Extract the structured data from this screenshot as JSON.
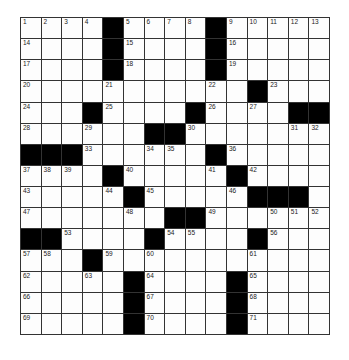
{
  "puzzle": {
    "rows": 15,
    "cols": 15,
    "grid": [
      "....#....#.....",
      "....#....#.....",
      "....#....#.....",
      "...........#...",
      "...#....#....##",
      "......##.......",
      "###......#.....",
      "....#.....#....",
      ".....#.....###.",
      ".......##......",
      "##....#....#...",
      "...#...........",
      ".....#....#....",
      ".....#....#....",
      ".....#....#...."
    ],
    "numbers": [
      {
        "r": 0,
        "c": 0,
        "n": "1"
      },
      {
        "r": 0,
        "c": 1,
        "n": "2"
      },
      {
        "r": 0,
        "c": 2,
        "n": "3"
      },
      {
        "r": 0,
        "c": 3,
        "n": "4"
      },
      {
        "r": 0,
        "c": 5,
        "n": "5"
      },
      {
        "r": 0,
        "c": 6,
        "n": "6"
      },
      {
        "r": 0,
        "c": 7,
        "n": "7"
      },
      {
        "r": 0,
        "c": 8,
        "n": "8"
      },
      {
        "r": 0,
        "c": 10,
        "n": "9"
      },
      {
        "r": 0,
        "c": 11,
        "n": "10"
      },
      {
        "r": 0,
        "c": 12,
        "n": "11"
      },
      {
        "r": 0,
        "c": 13,
        "n": "12"
      },
      {
        "r": 0,
        "c": 14,
        "n": "13"
      },
      {
        "r": 1,
        "c": 0,
        "n": "14"
      },
      {
        "r": 1,
        "c": 5,
        "n": "15"
      },
      {
        "r": 1,
        "c": 10,
        "n": "16"
      },
      {
        "r": 2,
        "c": 0,
        "n": "17"
      },
      {
        "r": 2,
        "c": 5,
        "n": "18"
      },
      {
        "r": 2,
        "c": 10,
        "n": "19"
      },
      {
        "r": 3,
        "c": 0,
        "n": "20"
      },
      {
        "r": 3,
        "c": 4,
        "n": "21"
      },
      {
        "r": 3,
        "c": 9,
        "n": "22"
      },
      {
        "r": 3,
        "c": 12,
        "n": "23"
      },
      {
        "r": 4,
        "c": 0,
        "n": "24"
      },
      {
        "r": 4,
        "c": 4,
        "n": "25"
      },
      {
        "r": 4,
        "c": 9,
        "n": "26"
      },
      {
        "r": 4,
        "c": 11,
        "n": "27"
      },
      {
        "r": 5,
        "c": 0,
        "n": "28"
      },
      {
        "r": 5,
        "c": 3,
        "n": "29"
      },
      {
        "r": 5,
        "c": 8,
        "n": "30"
      },
      {
        "r": 5,
        "c": 13,
        "n": "31"
      },
      {
        "r": 5,
        "c": 14,
        "n": "32"
      },
      {
        "r": 6,
        "c": 3,
        "n": "33"
      },
      {
        "r": 6,
        "c": 6,
        "n": "34"
      },
      {
        "r": 6,
        "c": 7,
        "n": "35"
      },
      {
        "r": 6,
        "c": 10,
        "n": "36"
      },
      {
        "r": 7,
        "c": 0,
        "n": "37"
      },
      {
        "r": 7,
        "c": 1,
        "n": "38"
      },
      {
        "r": 7,
        "c": 2,
        "n": "39"
      },
      {
        "r": 7,
        "c": 5,
        "n": "40"
      },
      {
        "r": 7,
        "c": 9,
        "n": "41"
      },
      {
        "r": 7,
        "c": 11,
        "n": "42"
      },
      {
        "r": 8,
        "c": 0,
        "n": "43"
      },
      {
        "r": 8,
        "c": 4,
        "n": "44"
      },
      {
        "r": 8,
        "c": 6,
        "n": "45"
      },
      {
        "r": 8,
        "c": 10,
        "n": "46"
      },
      {
        "r": 9,
        "c": 0,
        "n": "47"
      },
      {
        "r": 9,
        "c": 5,
        "n": "48"
      },
      {
        "r": 9,
        "c": 9,
        "n": "49"
      },
      {
        "r": 9,
        "c": 12,
        "n": "50"
      },
      {
        "r": 9,
        "c": 13,
        "n": "51"
      },
      {
        "r": 9,
        "c": 14,
        "n": "52"
      },
      {
        "r": 10,
        "c": 2,
        "n": "53"
      },
      {
        "r": 10,
        "c": 7,
        "n": "54"
      },
      {
        "r": 10,
        "c": 8,
        "n": "55"
      },
      {
        "r": 10,
        "c": 12,
        "n": "56"
      },
      {
        "r": 11,
        "c": 0,
        "n": "57"
      },
      {
        "r": 11,
        "c": 1,
        "n": "58"
      },
      {
        "r": 11,
        "c": 4,
        "n": "59"
      },
      {
        "r": 11,
        "c": 6,
        "n": "60"
      },
      {
        "r": 11,
        "c": 11,
        "n": "61"
      },
      {
        "r": 12,
        "c": 0,
        "n": "62"
      },
      {
        "r": 12,
        "c": 3,
        "n": "63"
      },
      {
        "r": 12,
        "c": 6,
        "n": "64"
      },
      {
        "r": 12,
        "c": 11,
        "n": "65"
      },
      {
        "r": 13,
        "c": 0,
        "n": "66"
      },
      {
        "r": 13,
        "c": 6,
        "n": "67"
      },
      {
        "r": 13,
        "c": 11,
        "n": "68"
      },
      {
        "r": 14,
        "c": 0,
        "n": "69"
      },
      {
        "r": 14,
        "c": 6,
        "n": "70"
      },
      {
        "r": 14,
        "c": 11,
        "n": "71"
      }
    ]
  }
}
